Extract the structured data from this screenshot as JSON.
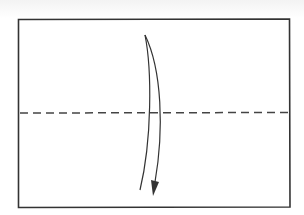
{
  "diagram": {
    "type": "origami-fold-step",
    "paper": {
      "x": 18,
      "y": 19,
      "width": 272,
      "height": 188,
      "stroke": "#333333"
    },
    "fold_line": {
      "style": "dashed",
      "kind": "valley-fold",
      "y": 113,
      "x1": 20,
      "x2": 289,
      "stroke": "#444444"
    },
    "arrow": {
      "direction": "down",
      "meaning": "fold top half down",
      "stroke": "#333333"
    }
  }
}
